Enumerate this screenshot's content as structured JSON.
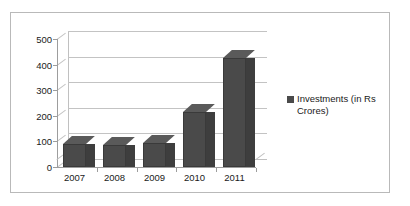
{
  "chart_data": {
    "type": "bar",
    "title": "",
    "xlabel": "",
    "ylabel": "",
    "categories": [
      "2007",
      "2008",
      "2009",
      "2010",
      "2011"
    ],
    "values": [
      90,
      85,
      95,
      215,
      425
    ],
    "series": [
      {
        "name": "Investments (in Rs Crores)",
        "values": [
          90,
          85,
          95,
          215,
          425
        ]
      }
    ],
    "ylim": [
      0,
      500
    ],
    "yticks": [
      0,
      100,
      200,
      300,
      400,
      500
    ],
    "ytick_labels": [
      "0",
      "100",
      "200",
      "300",
      "400",
      "500"
    ],
    "grid": true,
    "legend_position": "right",
    "style": "3d-column",
    "bar_color": "#4a4a4a",
    "grid_color": "#c3c3c3",
    "axis_color": "#9d9d9d",
    "border_color": "#b9b9b9",
    "background": "#ffffff"
  },
  "legend": {
    "entries": [
      {
        "label": "Investments (in Rs Crores)",
        "color": "#4a4a4a",
        "marker": "square-marker"
      }
    ]
  }
}
